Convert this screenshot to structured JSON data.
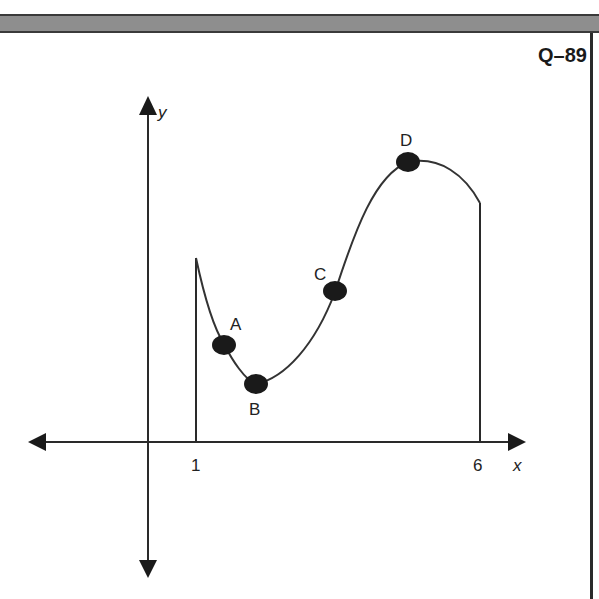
{
  "header": {
    "question_label": "Q–89"
  },
  "axes": {
    "x_label": "x",
    "y_label": "y",
    "x_ticks": [
      "1",
      "6"
    ]
  },
  "points": [
    {
      "label": "A"
    },
    {
      "label": "B"
    },
    {
      "label": "C"
    },
    {
      "label": "D"
    }
  ],
  "colors": {
    "curve": "#333333",
    "points": "#1a1a1a",
    "bar": "#8e8e8e"
  }
}
